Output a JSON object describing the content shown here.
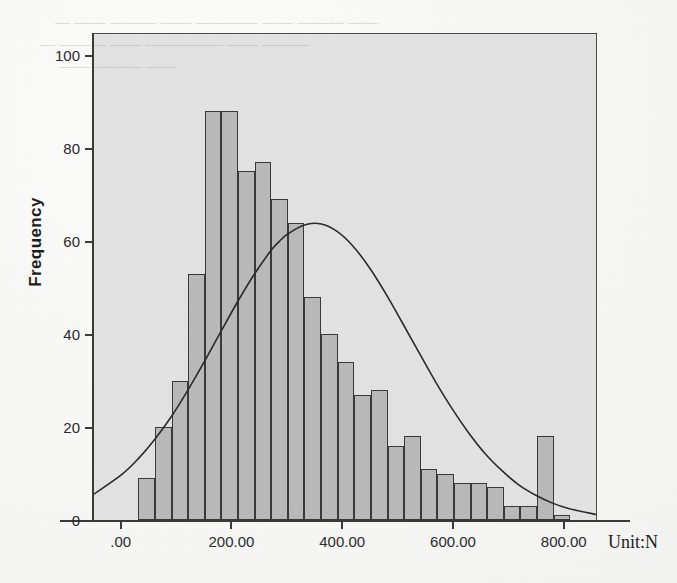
{
  "figure": {
    "kind": "spss-histogram",
    "background_color": "#ffffff",
    "plot_background_color": "#e2e2e2",
    "bar_fill_color": "#b9b9b9",
    "bar_border_color": "#3a3a3a",
    "curve_color": "#2b2b2b",
    "axis_color": "#3a3a3a"
  },
  "axes": {
    "y_title": "Frequency",
    "y_ticks": [
      {
        "value": 0,
        "label": "0"
      },
      {
        "value": 20,
        "label": "20"
      },
      {
        "value": 40,
        "label": "40"
      },
      {
        "value": 60,
        "label": "60"
      },
      {
        "value": 80,
        "label": "80"
      },
      {
        "value": 100,
        "label": "100"
      }
    ],
    "x_ticks": [
      {
        "value": 0,
        "label": ".00"
      },
      {
        "value": 200,
        "label": "200.00"
      },
      {
        "value": 400,
        "label": "400.00"
      },
      {
        "value": 600,
        "label": "600.00"
      },
      {
        "value": 800,
        "label": "800.00"
      }
    ],
    "x_unit_label": "Unit:N"
  },
  "scan_artifacts": {
    "bleed_lines": [
      {
        "text": "— —— ——— —— ———— —— ——— ——",
        "left": 55,
        "top": 14,
        "size": 15
      },
      {
        "text": "— ——— —— ————— —— ———",
        "left": 40,
        "top": 36,
        "size": 15
      },
      {
        "text": "—— ——— ——",
        "left": 60,
        "top": 58,
        "size": 15
      }
    ]
  },
  "chart_data": {
    "type": "bar",
    "subtype": "histogram-with-normal-curve",
    "title": "",
    "xlabel": "Unit:N",
    "ylabel": "Frequency",
    "xlim": [
      -50,
      860
    ],
    "ylim": [
      0,
      105
    ],
    "grid": false,
    "legend": false,
    "bin_width": 30,
    "bin_starts": [
      30,
      60,
      90,
      120,
      150,
      180,
      210,
      240,
      270,
      300,
      330,
      360,
      390,
      420,
      450,
      480,
      510,
      540,
      570,
      600,
      630,
      660,
      690,
      720,
      750,
      780
    ],
    "categories": [
      "30-60",
      "60-90",
      "90-120",
      "120-150",
      "150-180",
      "180-210",
      "210-240",
      "240-270",
      "270-300",
      "300-330",
      "330-360",
      "360-390",
      "390-420",
      "420-450",
      "450-480",
      "480-510",
      "510-540",
      "540-570",
      "570-600",
      "600-630",
      "630-660",
      "660-690",
      "690-720",
      "720-750",
      "750-780",
      "780-810"
    ],
    "values": [
      9,
      20,
      30,
      53,
      88,
      88,
      75,
      77,
      69,
      64,
      48,
      40,
      34,
      27,
      28,
      16,
      18,
      11,
      10,
      8,
      8,
      7,
      3,
      3,
      18,
      1
    ],
    "normal_curve": {
      "label": "Normal",
      "peak_value": 64,
      "peak_x": 285,
      "sigma": 148,
      "points_x": [
        -50,
        0,
        30,
        60,
        90,
        120,
        150,
        180,
        210,
        240,
        270,
        285,
        300,
        330,
        360,
        390,
        420,
        450,
        480,
        510,
        540,
        570,
        600,
        630,
        660,
        690,
        720,
        750,
        780,
        810,
        860
      ],
      "points_y": [
        5.6,
        9.8,
        13.2,
        17.4,
        22.3,
        28.0,
        34.2,
        40.7,
        47.1,
        53.0,
        58.1,
        60.1,
        61.7,
        63.7,
        64.0,
        62.4,
        59.1,
        54.4,
        48.7,
        42.4,
        36.0,
        29.7,
        23.9,
        18.7,
        14.2,
        10.6,
        7.6,
        5.4,
        3.7,
        2.5,
        1.2
      ]
    }
  }
}
